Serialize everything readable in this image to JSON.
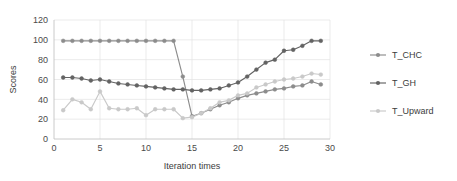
{
  "chart_data": {
    "type": "line",
    "title": "",
    "xlabel": "Iteration times",
    "ylabel": "Scores",
    "xlim": [
      0,
      30
    ],
    "ylim": [
      0,
      120
    ],
    "xticks": [
      0,
      5,
      10,
      15,
      20,
      25,
      30
    ],
    "yticks": [
      0,
      20,
      40,
      60,
      80,
      100,
      120
    ],
    "grid": true,
    "legend_position": "right",
    "x": [
      1,
      2,
      3,
      4,
      5,
      6,
      7,
      8,
      9,
      10,
      11,
      12,
      13,
      14,
      15,
      16,
      17,
      18,
      19,
      20,
      21,
      22,
      23,
      24,
      25,
      26,
      27,
      28,
      29
    ],
    "series": [
      {
        "name": "T_CHC",
        "color": "#8c8c8c",
        "values": [
          99,
          99,
          99,
          99,
          99,
          99,
          99,
          99,
          99,
          99,
          99,
          99,
          99,
          63,
          23,
          26,
          30,
          34,
          37,
          41,
          44,
          46,
          48,
          50,
          51,
          53,
          54,
          58,
          55
        ]
      },
      {
        "name": "T_GH",
        "color": "#636363",
        "values": [
          62,
          62,
          61,
          59,
          60,
          58,
          56,
          55,
          54,
          53,
          52,
          51,
          50,
          50,
          49,
          49,
          50,
          51,
          54,
          57,
          63,
          70,
          77,
          80,
          89,
          90,
          94,
          99,
          99
        ]
      },
      {
        "name": "T_Upward",
        "color": "#c9c9c9",
        "values": [
          29,
          40,
          37,
          30,
          48,
          31,
          30,
          30,
          31,
          24,
          30,
          30,
          30,
          21,
          22,
          26,
          31,
          37,
          39,
          44,
          46,
          52,
          55,
          58,
          60,
          61,
          63,
          66,
          65
        ]
      }
    ]
  },
  "legend": {
    "items": [
      {
        "label": "T_CHC",
        "color": "#8c8c8c"
      },
      {
        "label": "T_GH",
        "color": "#636363"
      },
      {
        "label": "T_Upward",
        "color": "#c9c9c9"
      }
    ]
  },
  "axes": {
    "x_title": "Iteration times",
    "y_title": "Scores",
    "x_tick_labels": [
      "0",
      "5",
      "10",
      "15",
      "20",
      "25",
      "30"
    ],
    "y_tick_labels": [
      "0",
      "20",
      "40",
      "60",
      "80",
      "100",
      "120"
    ]
  }
}
